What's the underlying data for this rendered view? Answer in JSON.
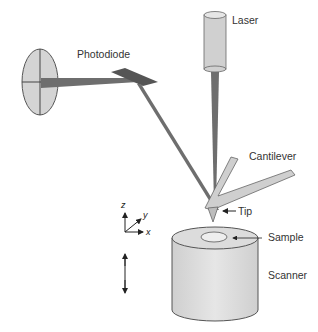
{
  "diagram": {
    "labels": {
      "laser": "Laser",
      "photodiode": "Photodiode",
      "cantilever": "Cantilever",
      "tip": "Tip",
      "sample": "Sample",
      "scanner": "Scanner"
    },
    "axes": {
      "z": "z",
      "y": "y",
      "x": "x"
    },
    "colors": {
      "beam": "#6e6e6e",
      "body_fill": "#d9d9d9",
      "outline": "#555555",
      "text": "#333333"
    }
  }
}
